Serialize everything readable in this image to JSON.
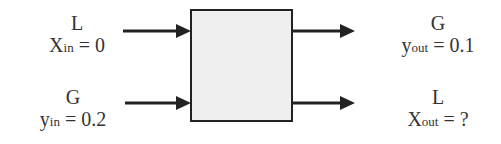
{
  "diagram": {
    "box": {
      "fill": "#efefef",
      "stroke": "#222222"
    },
    "inputs": [
      {
        "stream": "L",
        "var": "X",
        "sub": "in",
        "value": "= 0"
      },
      {
        "stream": "G",
        "var": "y",
        "sub": "in",
        "value": "= 0.2"
      }
    ],
    "outputs": [
      {
        "stream": "G",
        "var": "y",
        "sub": "out",
        "value": "= 0.1"
      },
      {
        "stream": "L",
        "var": "X",
        "sub": "out",
        "value": "= ?"
      }
    ]
  }
}
